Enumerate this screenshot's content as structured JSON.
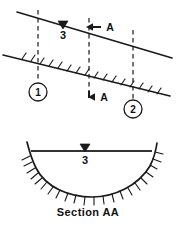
{
  "figure": {
    "caption": "Section AA",
    "plan_view": {
      "water_depth_label": "3",
      "section_cut_label_upper": "A",
      "section_cut_label_lower": "A",
      "stations": [
        {
          "label": "1"
        },
        {
          "label": "2"
        }
      ]
    },
    "cross_section": {
      "water_depth_label": "3"
    },
    "colors": {
      "ink": "#1a1a1a",
      "background": "#ffffff",
      "water_surface": "#333333"
    }
  }
}
